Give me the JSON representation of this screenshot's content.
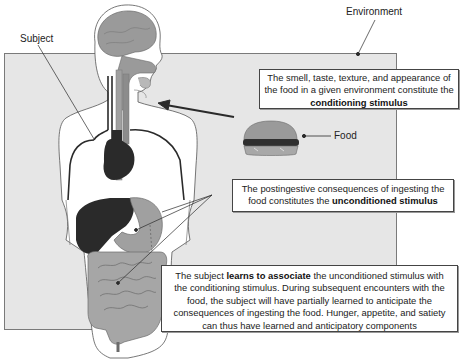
{
  "labels": {
    "environment": "Environment",
    "subject": "Subject",
    "food": "Food"
  },
  "boxes": {
    "conditioning": {
      "text_before": "The smell, taste, texture, and appearance of the food in a given environment constitute the",
      "bold": "conditioning stimulus",
      "text_after": ""
    },
    "unconditioned": {
      "text_before": "The postingestive consequences of ingesting the food constitutes the",
      "bold": "unconditioned stimulus",
      "text_after": ""
    },
    "association": {
      "text_before": "The subject",
      "bold": "learns to associate",
      "text_after": "the unconditioned stimulus with the conditioning stimulus. During subsequent encounters with the food, the subject will have partially learned to anticipate the consequences of ingesting the food. Hunger, appetite, and satiety can thus have learned and anticipatory components"
    }
  },
  "colors": {
    "environment_fill": "#e6e6e6",
    "organ_dark": "#2a2a2a",
    "organ_mid": "#8c8c8c",
    "organ_light": "#a8a8a8",
    "body_fill": "#ffffff"
  }
}
